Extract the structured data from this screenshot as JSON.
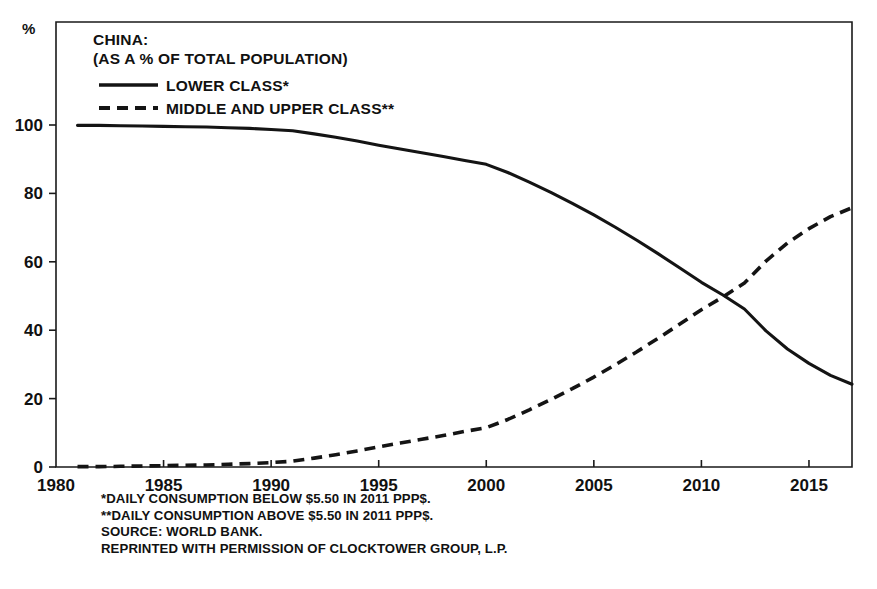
{
  "chart_data": {
    "type": "line",
    "title": "CHINA:",
    "subtitle": "(AS A % OF TOTAL POPULATION)",
    "xlabel": "",
    "ylabel": "%",
    "unit_label": "%",
    "xlim": [
      1980,
      2017
    ],
    "ylim": [
      0,
      108
    ],
    "grid": false,
    "legend_position": "top-left",
    "xticks": [
      1980,
      1985,
      1990,
      1995,
      2000,
      2005,
      2010,
      2015
    ],
    "yticks": [
      0,
      20,
      40,
      60,
      80,
      100
    ],
    "xtick_labels": [
      "1980",
      "1985",
      "1990",
      "1995",
      "2000",
      "2005",
      "2010",
      "2015"
    ],
    "ytick_labels": [
      "0",
      "20",
      "40",
      "60",
      "80",
      "100"
    ],
    "series": [
      {
        "name": "LOWER CLASS*",
        "style": "solid",
        "x": [
          1981,
          1982,
          1983,
          1984,
          1985,
          1986,
          1987,
          1988,
          1989,
          1990,
          1991,
          1992,
          1993,
          1994,
          1995,
          1996,
          1997,
          1998,
          1999,
          2000,
          2001,
          2002,
          2003,
          2004,
          2005,
          2006,
          2007,
          2008,
          2009,
          2010,
          2011,
          2012,
          2013,
          2014,
          2015,
          2016,
          2017
        ],
        "values": [
          99.9,
          99.9,
          99.8,
          99.7,
          99.6,
          99.5,
          99.4,
          99.2,
          99.0,
          98.7,
          98.3,
          97.4,
          96.4,
          95.3,
          94.1,
          93.0,
          91.9,
          90.8,
          89.6,
          88.5,
          86.1,
          83.3,
          80.3,
          77.1,
          73.7,
          70.1,
          66.3,
          62.3,
          58.2,
          54.0,
          50.3,
          46.2,
          39.8,
          34.5,
          30.3,
          26.8,
          24.2
        ]
      },
      {
        "name": "MIDDLE AND UPPER CLASS**",
        "style": "dashed",
        "x": [
          1981,
          1982,
          1983,
          1984,
          1985,
          1986,
          1987,
          1988,
          1989,
          1990,
          1991,
          1992,
          1993,
          1994,
          1995,
          1996,
          1997,
          1998,
          1999,
          2000,
          2001,
          2002,
          2003,
          2004,
          2005,
          2006,
          2007,
          2008,
          2009,
          2010,
          2011,
          2012,
          2013,
          2014,
          2015,
          2016,
          2017
        ],
        "values": [
          0.1,
          0.1,
          0.2,
          0.3,
          0.4,
          0.5,
          0.6,
          0.8,
          1.0,
          1.3,
          1.7,
          2.6,
          3.6,
          4.7,
          5.9,
          7.0,
          8.1,
          9.2,
          10.4,
          11.5,
          13.9,
          16.7,
          19.7,
          22.9,
          26.3,
          29.9,
          33.7,
          37.7,
          41.8,
          46.0,
          49.7,
          53.8,
          60.2,
          65.5,
          69.7,
          73.2,
          75.8
        ]
      }
    ],
    "footnotes": [
      "*DAILY CONSUMPTION BELOW $5.50 IN 2011 PPP$.",
      "**DAILY CONSUMPTION ABOVE $5.50 IN 2011 PPP$.",
      "SOURCE: WORLD BANK.",
      "REPRINTED WITH PERMISSION OF CLOCKTOWER GROUP, L.P."
    ],
    "colors": {
      "line": "#141414",
      "axis": "#1a1a1a",
      "text": "#111111",
      "background": "#ffffff"
    }
  }
}
